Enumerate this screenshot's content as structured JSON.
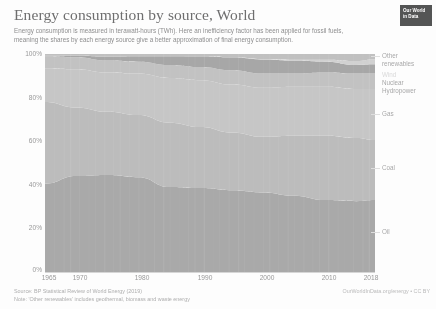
{
  "header": {
    "title": "Energy consumption by source, World",
    "subtitle": "Energy consumption is measured in terawatt-hours (TWh). Here an inefficiency factor has been applied for fossil fuels, meaning the shares by each energy source give a better approximation of final energy consumption.",
    "logo_line1": "Our World",
    "logo_line2": "in Data"
  },
  "footer": {
    "source": "Source: BP Statistical Review of World Energy (2019)",
    "note": "Note: 'Other renewables' includes geothermal, biomass and waste energy",
    "credit": "OurWorldInData.org/energy • CC BY"
  },
  "colors": {
    "other_renewables": "#b6b6b6",
    "wind": "#c9c9c9",
    "nuclear": "#9a9a9a",
    "hydropower": "#b9b9b9",
    "gas": "#bdbdbd",
    "coal": "#b2b2b2",
    "oil": "#9d9d9d",
    "gridline": "#e2e2e2",
    "axis": "#cfcfcf",
    "text": "#8a8a8e",
    "logo_bg": "#3b3f44"
  },
  "series_labels": [
    {
      "name": "other-renewables",
      "text": "Other",
      "text2": "renewables",
      "y": 52,
      "faint": false,
      "leader": true,
      "leader_y": 56
    },
    {
      "name": "wind",
      "text": "Wind",
      "y": 71,
      "faint": true,
      "leader": false
    },
    {
      "name": "nuclear",
      "text": "Nuclear",
      "y": 79,
      "faint": false,
      "leader": false
    },
    {
      "name": "hydropower",
      "text": "Hydropower",
      "y": 87,
      "faint": false,
      "leader": false
    },
    {
      "name": "gas",
      "text": "Gas",
      "y": 110,
      "faint": false,
      "leader": true,
      "leader_y": 114
    },
    {
      "name": "coal",
      "text": "Coal",
      "y": 164,
      "faint": false,
      "leader": true,
      "leader_y": 168
    },
    {
      "name": "oil",
      "text": "Oil",
      "y": 228,
      "faint": false,
      "leader": true,
      "leader_y": 232
    }
  ],
  "chart_data": {
    "type": "area",
    "stacked": true,
    "normalized": true,
    "title": "Energy consumption by source, World",
    "subtitle": "Energy consumption is measured in terawatt-hours (TWh). Here an inefficiency factor has been applied for fossil fuels, meaning the shares by each energy source give a better approximation of final energy consumption.",
    "xlabel": "",
    "ylabel": "",
    "xlim": [
      1965,
      2018
    ],
    "ylim": [
      0,
      100
    ],
    "grid": true,
    "legend_position": "right-inline-labels",
    "y_ticks": [
      "0%",
      "20%",
      "40%",
      "60%",
      "80%",
      "100%"
    ],
    "y_tick_values": [
      0,
      20,
      40,
      60,
      80,
      100
    ],
    "x_ticks": [
      "1965",
      "1970",
      "1980",
      "1990",
      "2000",
      "2010",
      "2018"
    ],
    "x_tick_values": [
      1965,
      1970,
      1980,
      1990,
      2000,
      2010,
      2018
    ],
    "x": [
      1965,
      1970,
      1975,
      1980,
      1985,
      1990,
      1995,
      2000,
      2005,
      2010,
      2015,
      2018
    ],
    "series": [
      {
        "name": "Oil",
        "values": [
          40.5,
          44.0,
          44.5,
          43.5,
          39.0,
          38.5,
          37.5,
          36.5,
          35.0,
          33.0,
          32.5,
          33.0
        ]
      },
      {
        "name": "Coal",
        "values": [
          37.5,
          31.5,
          29.0,
          28.5,
          29.5,
          28.0,
          26.5,
          25.5,
          27.5,
          29.5,
          29.0,
          27.5
        ]
      },
      {
        "name": "Gas",
        "values": [
          15.5,
          17.5,
          18.0,
          19.0,
          20.5,
          21.5,
          22.0,
          22.5,
          22.5,
          22.5,
          22.5,
          23.5
        ]
      },
      {
        "name": "Hydropower",
        "values": [
          5.5,
          5.5,
          5.5,
          5.5,
          6.0,
          6.0,
          6.5,
          6.5,
          6.0,
          6.5,
          7.0,
          7.0
        ]
      },
      {
        "name": "Nuclear",
        "values": [
          0.3,
          0.7,
          1.8,
          2.5,
          4.0,
          5.0,
          6.0,
          6.5,
          6.0,
          5.0,
          4.0,
          4.3
        ]
      },
      {
        "name": "Wind",
        "values": [
          0.0,
          0.0,
          0.0,
          0.0,
          0.0,
          0.1,
          0.1,
          0.2,
          0.4,
          0.9,
          1.8,
          2.3
        ]
      },
      {
        "name": "Other renewables",
        "values": [
          0.7,
          0.8,
          1.2,
          1.0,
          1.0,
          0.9,
          1.4,
          2.3,
          2.6,
          2.6,
          3.2,
          2.4
        ]
      }
    ]
  }
}
